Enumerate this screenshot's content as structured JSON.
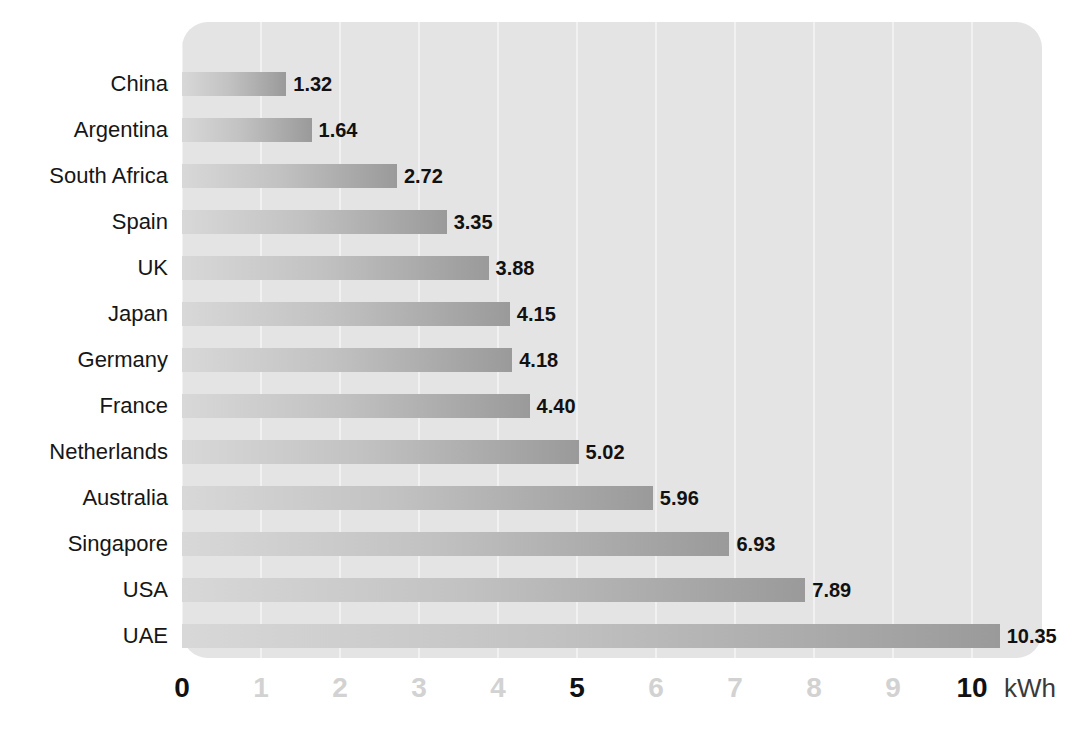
{
  "chart_data": {
    "type": "bar",
    "orientation": "horizontal",
    "title": "",
    "subtitle": "",
    "xlabel": "kWh",
    "ylabel": "",
    "xlim": [
      0,
      10.9
    ],
    "grid": true,
    "legend": null,
    "categories": [
      "China",
      "Argentina",
      "South Africa",
      "Spain",
      "UK",
      "Japan",
      "Germany",
      "France",
      "Netherlands",
      "Australia",
      "Singapore",
      "USA",
      "UAE"
    ],
    "values": [
      1.32,
      1.64,
      2.72,
      3.35,
      3.88,
      4.15,
      4.18,
      4.4,
      5.02,
      5.96,
      6.93,
      7.89,
      10.35
    ],
    "value_labels": [
      "1.32",
      "1.64",
      "2.72",
      "3.35",
      "3.88",
      "4.15",
      "4.18",
      "4.40",
      "5.02",
      "5.96",
      "6.93",
      "7.89",
      "10.35"
    ],
    "x_ticks": [
      {
        "value": 0,
        "label": "0",
        "emphasis": "major"
      },
      {
        "value": 1,
        "label": "1",
        "emphasis": "minor"
      },
      {
        "value": 2,
        "label": "2",
        "emphasis": "minor"
      },
      {
        "value": 3,
        "label": "3",
        "emphasis": "minor"
      },
      {
        "value": 4,
        "label": "4",
        "emphasis": "minor"
      },
      {
        "value": 5,
        "label": "5",
        "emphasis": "major"
      },
      {
        "value": 6,
        "label": "6",
        "emphasis": "minor"
      },
      {
        "value": 7,
        "label": "7",
        "emphasis": "minor"
      },
      {
        "value": 8,
        "label": "8",
        "emphasis": "minor"
      },
      {
        "value": 9,
        "label": "9",
        "emphasis": "minor"
      },
      {
        "value": 10,
        "label": "10",
        "emphasis": "major"
      }
    ],
    "unit_label": "kWh",
    "colors": {
      "plot_background": "#e4e4e4",
      "gridline": "#f1f1f1",
      "bar_gradient_start": "#d8d8d8",
      "bar_gradient_end": "#9a9a9a",
      "category_label": "#161616",
      "value_label": "#111111",
      "tick_major": "#111111",
      "tick_minor": "#d2d2d2",
      "page_background": "#ffffff"
    }
  }
}
